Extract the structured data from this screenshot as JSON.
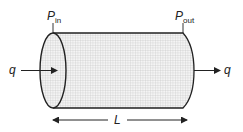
{
  "diagram": {
    "type": "pipe-flow-schematic",
    "labels": {
      "inlet_pressure": {
        "symbol": "P",
        "subscript": "in"
      },
      "outlet_pressure": {
        "symbol": "P",
        "subscript": "out"
      },
      "flow_in": "q",
      "flow_out": "q",
      "length": "L"
    },
    "colors": {
      "stroke": "#222222",
      "fill_grid": "#c8c8c8",
      "background": "#ffffff"
    }
  }
}
